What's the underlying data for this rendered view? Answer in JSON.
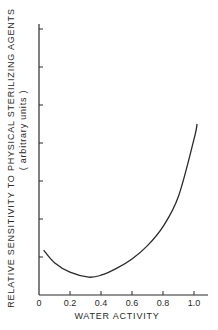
{
  "chart_data": {
    "type": "line",
    "title": "",
    "xlabel": "WATER ACTIVITY",
    "ylabel": "RELATIVE SENSITIVITY TO PHYSICAL STERILIZING AGENTS",
    "ylabel_sub": "( arbitrary units )",
    "x_ticks": [
      "0",
      "0.2",
      "0.4",
      "0.6",
      "0.8",
      "1.0"
    ],
    "x_tick_values": [
      0,
      0.2,
      0.4,
      0.6,
      0.8,
      1.0
    ],
    "y_tick_count": 7,
    "y_ticks_labeled": false,
    "xlim": [
      0,
      1.1
    ],
    "ylim": [
      0,
      7.5
    ],
    "grid": false,
    "legend": null,
    "series": [
      {
        "name": "sensitivity",
        "x": [
          0.03,
          0.1,
          0.2,
          0.32,
          0.4,
          0.5,
          0.6,
          0.7,
          0.8,
          0.9,
          1.0,
          1.02
        ],
        "y": [
          1.18,
          0.85,
          0.6,
          0.47,
          0.52,
          0.7,
          0.95,
          1.3,
          1.8,
          2.6,
          4.1,
          4.5
        ]
      }
    ]
  }
}
